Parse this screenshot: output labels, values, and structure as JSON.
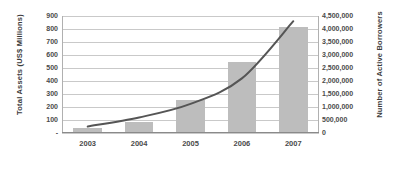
{
  "chart_data": {
    "type": "bar",
    "title": "",
    "subtitle": "",
    "xlabel": "",
    "ylabel": "Total Assets (US$ Millions)",
    "y2label": "Number of Active Borrowers",
    "categories": [
      "2003",
      "2004",
      "2005",
      "2006",
      "2007"
    ],
    "grid": true,
    "legend_position": "none",
    "ylim": [
      0,
      900
    ],
    "y2lim": [
      0,
      4500000
    ],
    "ytick_labels": [
      "900",
      "800",
      "700",
      "600",
      "500",
      "400",
      "300",
      "200",
      "100",
      "-"
    ],
    "ytick_values": [
      900,
      800,
      700,
      600,
      500,
      400,
      300,
      200,
      100,
      0
    ],
    "y2tick_labels": [
      "4,500,000",
      "4,000,000",
      "3,500,000",
      "3,000,000",
      "2,500,000",
      "2,000,000",
      "1,500,000",
      "1,000,000",
      "500,000",
      "0"
    ],
    "y2tick_values": [
      4500000,
      4000000,
      3500000,
      3000000,
      2500000,
      2000000,
      1500000,
      1000000,
      500000,
      0
    ],
    "series": [
      {
        "name": "Total Assets (US$ Millions)",
        "type": "bar",
        "axis": "left",
        "color": "#bdbdbd",
        "values": [
          35,
          85,
          255,
          545,
          815
        ]
      },
      {
        "name": "Number of Active Borrowers",
        "type": "line",
        "axis": "right",
        "color": "#555555",
        "values": [
          250000,
          600000,
          1120000,
          2100000,
          4300000
        ]
      }
    ]
  }
}
